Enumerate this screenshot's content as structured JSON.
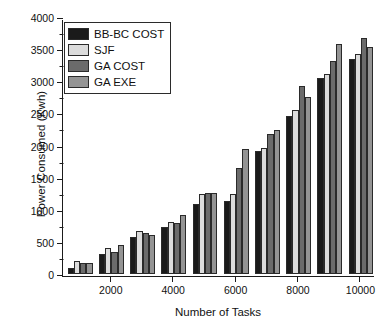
{
  "chart_data": {
    "type": "bar",
    "title": "",
    "subtitle": "",
    "xlabel": "Number of Tasks",
    "ylabel": "Power Consumed (Kwh)",
    "categories": [
      1000,
      2000,
      3000,
      4000,
      5000,
      6000,
      7000,
      8000,
      9000,
      10000
    ],
    "xtick_labels": [
      "2000",
      "4000",
      "6000",
      "8000",
      "10000"
    ],
    "xtick_values": [
      2000,
      4000,
      6000,
      8000,
      10000
    ],
    "ytick_labels": [
      "0",
      "500",
      "1000",
      "1500",
      "2000",
      "2500",
      "3000",
      "3500",
      "4000"
    ],
    "ytick_values": [
      0,
      500,
      1000,
      1500,
      2000,
      2500,
      3000,
      3500,
      4000
    ],
    "xlim": [
      500,
      10500
    ],
    "ylim": [
      0,
      4000
    ],
    "grid": false,
    "legend_position": "top-left",
    "series": [
      {
        "name": "BB-BC COST",
        "color": "#1a1a1a",
        "values": [
          105,
          320,
          590,
          735,
          1100,
          1150,
          1915,
          2470,
          3060,
          3350
        ]
      },
      {
        "name": "SJF",
        "color": "#dcdcdc",
        "values": [
          205,
          405,
          680,
          810,
          1250,
          1255,
          1975,
          2555,
          3120,
          3430
        ]
      },
      {
        "name": "GA COST",
        "color": "#6b6b6b",
        "values": [
          170,
          350,
          640,
          800,
          1270,
          1660,
          2180,
          2925,
          3325,
          3680
        ]
      },
      {
        "name": "GA EXE",
        "color": "#949494",
        "values": [
          170,
          465,
          615,
          930,
          1275,
          1955,
          2245,
          2765,
          3590,
          3545
        ]
      }
    ]
  },
  "legend": {
    "items": [
      {
        "label": "BB-BC COST",
        "color": "#1a1a1a"
      },
      {
        "label": "SJF",
        "color": "#dcdcdc"
      },
      {
        "label": "GA COST",
        "color": "#6b6b6b"
      },
      {
        "label": "GA EXE",
        "color": "#949494"
      }
    ]
  }
}
